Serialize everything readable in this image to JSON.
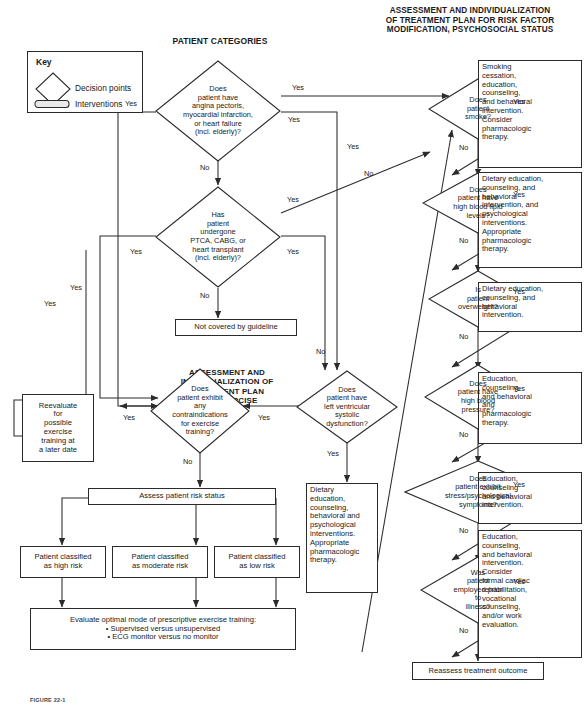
{
  "figure": {
    "caption": "FIGURE 22-1"
  },
  "headers": {
    "patient_categories": "PATIENT CATEGORIES",
    "risk_factor": "ASSESSMENT AND INDIVIDUALIZATION\nOF TREATMENT PLAN FOR RISK FACTOR\nMODIFICATION, PSYCHOSOCIAL STATUS",
    "exercise_training": "ASSESSMENT AND\nINDIVIDUALIZATION OF\nTREATMENT PLAN\nFOR EXERCISE\nTRAINING"
  },
  "key": {
    "title": "Key",
    "decision_label": "Decision points",
    "intervention_label": "Interventions"
  },
  "decisions": {
    "angina": "Does\npatient have\nangina pectoris,\nmyocardial infarction,\nor heart failure\n(incl. elderly)?",
    "ptca": "Has\npatient\nundergone\nPTCA, CABG, or\nheart transplant\n(incl. elderly)?",
    "lv": "Does\npatient have\nleft ventricular\nsystolic\ndysfunction?",
    "contraindications": "Does\npatient exhibit\nany\ncontraindications\nfor exercise\ntraining?",
    "smoke": "Does\npatient\nsmoke?",
    "lipid": "Does\npatient have\nhigh blood lipid\nlevels?",
    "overweight": "Is\npatient\noverweight?",
    "bp": "Does\npatient have\nhigh blood\npressure?",
    "stress": "Does\npatient exhibit\nstress/psychological\nsymptoms?",
    "employed": "Was\npatient\nemployed prior\nto\nillness?"
  },
  "interventions": {
    "not_covered": "Not covered by guideline",
    "reevaluate": "Reevaluate\nfor\npossible\nexercise\ntraining at\na later date",
    "assess_risk": "Assess patient risk status",
    "high_risk": "Patient classified\nas high risk",
    "moderate_risk": "Patient classified\nas moderate risk",
    "low_risk": "Patient classified\nas low risk",
    "evaluate_mode": "Evaluate optimal mode of prescriptive exercise training:\n• Supervised versus unsupervised\n• ECG monitor versus no monitor",
    "dietary_lv": "Dietary\neducation,\ncounseling,\nbehavioral and\npsychological\ninterventions.\nAppropriate\npharmacologic\ntherapy.",
    "smoking_rx": "Smoking\ncessation,\neducation,\ncounseling,\nand behavioral\nintervention.\nConsider\npharmacologic\ntherapy.",
    "lipid_rx": "Dietary education,\ncounseling, and\nbehavioral\nintervention, and\npsychological\ninterventions.\nAppropriate\npharmacologic\ntherapy.",
    "overweight_rx": "Dietary education,\ncounseling, and\nbehavioral\nintervention.",
    "bp_rx": "Education,\ncounseling,\nand behavioral\nand\npharmacologic\ntherapy.",
    "stress_rx": "Education,\ncounseling\nand behavioral\nintervention.",
    "employed_rx": "Education,\ncounseling,\nand behavioral\nintervention.\nConsider\nformal cardiac\nrehabilitation,\nvocational\ncounseling,\nand/or work\nevaluation.",
    "reassess": "Reassess treatment outcome"
  },
  "edge_labels": {
    "yes": "Yes",
    "no": "No"
  },
  "colors": {
    "stroke": "#2b2b2b",
    "text": "#1a1a1a",
    "background": "#ffffff"
  }
}
